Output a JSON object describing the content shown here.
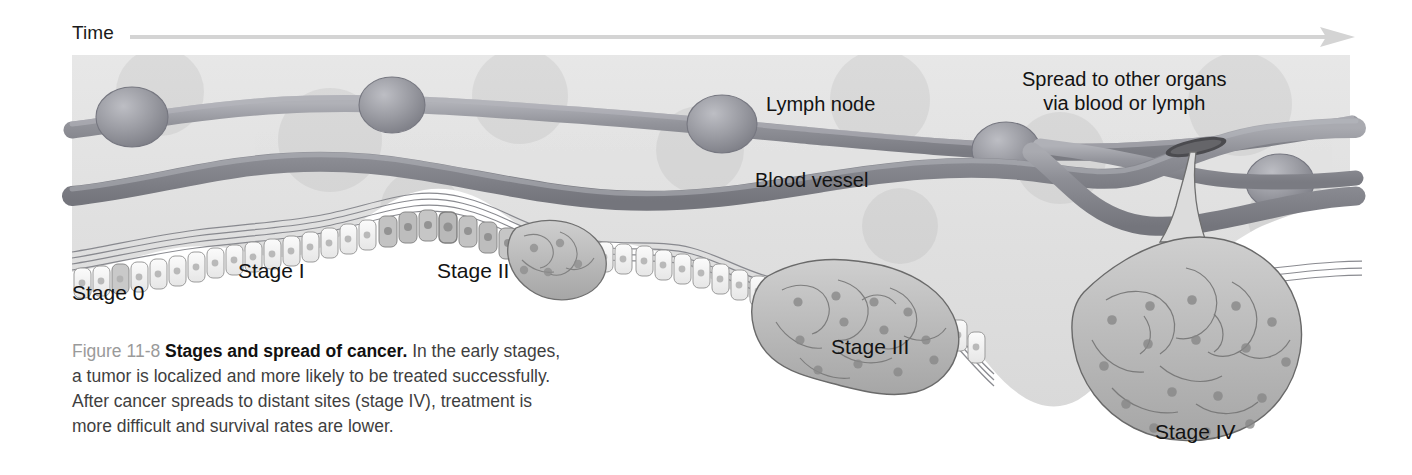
{
  "figure": {
    "number": "Figure 11-8",
    "title": "Stages and spread of cancer.",
    "body": "In the early stages, a tumor is localized and more likely to be treated successfully. After cancer spreads to distant sites (stage IV), treatment is more difficult and survival rates are lower."
  },
  "axis": {
    "label": "Time",
    "direction": "left-to-right",
    "arrow_color": "#d6d6d6"
  },
  "annotations": {
    "lymph_node": "Lymph node",
    "blood_vessel": "Blood vessel",
    "spread_line1": "Spread to other organs",
    "spread_line2": "via blood or lymph"
  },
  "stages": [
    {
      "id": "stage-0",
      "label": "Stage 0"
    },
    {
      "id": "stage-1",
      "label": "Stage I"
    },
    {
      "id": "stage-2",
      "label": "Stage II"
    },
    {
      "id": "stage-3",
      "label": "Stage III"
    },
    {
      "id": "stage-4",
      "label": "Stage IV"
    }
  ],
  "colors": {
    "panel_background": "#e2e2e2",
    "vessel_dark": "#8d8d93",
    "vessel_mid": "#9fa0a6",
    "lymph_node_fill": "#9a9aa0",
    "normal_cell_fill": "#f0f0f0",
    "tumor_cell_fill": "#b9b9b9",
    "membrane_line": "#7d7d82",
    "text_dark": "#131313",
    "caption_gray": "#9a9a9a"
  }
}
